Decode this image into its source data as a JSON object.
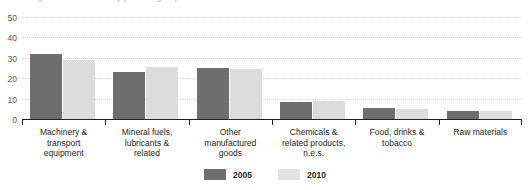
{
  "chart_data": {
    "type": "bar",
    "title": "Trade in goods with the EU by product group",
    "title_clipped": true,
    "xlabel": "",
    "ylabel": "",
    "ylim": [
      0,
      50
    ],
    "yticks": [
      0,
      10,
      20,
      30,
      40,
      50
    ],
    "ytick_labels": [
      "0",
      "10",
      "20",
      "30",
      "40",
      "50"
    ],
    "grid": true,
    "legend_position": "bottom-center",
    "categories": [
      "Machinery & transport equipment",
      "Mineral fuels, lubricants & related",
      "Other manufactured goods",
      "Chemicals & related products, n.e.s.",
      "Food, drinks & tobacco",
      "Raw materials"
    ],
    "category_lines": [
      [
        "Machinery &",
        "transport",
        "equipment"
      ],
      [
        "Mineral fuels,",
        "lubricants &",
        "related"
      ],
      [
        "Other",
        "manufactured",
        "goods"
      ],
      [
        "Chemicals &",
        "related products,",
        "n.e.s."
      ],
      [
        "Food, drinks &",
        "tobacco"
      ],
      [
        "Raw materials"
      ]
    ],
    "series": [
      {
        "name": "2005",
        "color": "#6e6e6e",
        "values": [
          32,
          23,
          25,
          8.5,
          5.5,
          4
        ]
      },
      {
        "name": "2010",
        "color": "#dcdcdc",
        "values": [
          29,
          25.5,
          24.5,
          9,
          5,
          4
        ]
      }
    ]
  },
  "legend": {
    "items": [
      {
        "label": "2005",
        "color": "#6e6e6e"
      },
      {
        "label": "2010",
        "color": "#e3e3e3"
      }
    ]
  }
}
